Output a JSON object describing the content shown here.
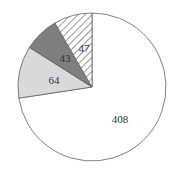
{
  "chart_data": {
    "type": "pie",
    "title": "",
    "start_angle": "12 o'clock",
    "direction": "clockwise",
    "legend": null,
    "slices": [
      {
        "label": "408",
        "value": 408,
        "fill": "#ffffff",
        "pattern": "none"
      },
      {
        "label": "64",
        "value": 64,
        "fill": "#d9d9d9",
        "pattern": "none"
      },
      {
        "label": "43",
        "value": 43,
        "fill": "#7f7f7f",
        "pattern": "none"
      },
      {
        "label": "47",
        "value": 47,
        "fill": "#ffffff",
        "pattern": "diagonal-hatch"
      }
    ],
    "total": 562
  },
  "labels": {
    "s0": "408",
    "s1": "64",
    "s2": "43",
    "s3": "47"
  },
  "colors": {
    "outline": "#606060",
    "hatch": "#555555"
  }
}
